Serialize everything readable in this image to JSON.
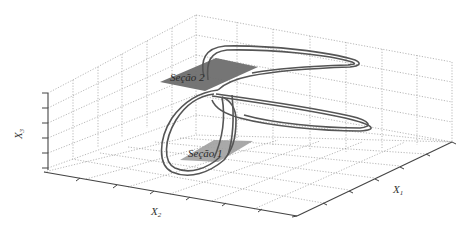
{
  "figure": {
    "type": "3d-phase-portrait",
    "axes": {
      "x_label": "X",
      "x_sub": "1",
      "y_label": "X",
      "y_sub": "2",
      "z_label": "X",
      "z_sub": "3"
    },
    "sections": [
      {
        "label": "Seção 2",
        "color": "#6e6e6e"
      },
      {
        "label": "Seção 1",
        "color": "#9a9a9a"
      }
    ],
    "colors": {
      "trajectory": "#555555",
      "grid": "#9a9a9a",
      "axis": "#444444"
    }
  }
}
